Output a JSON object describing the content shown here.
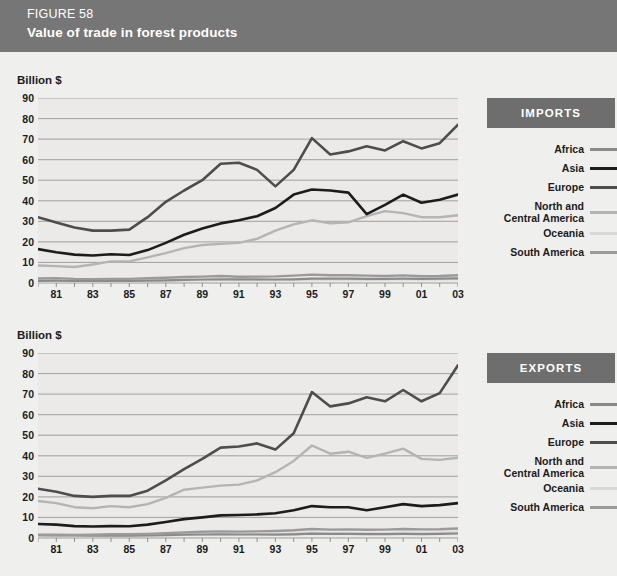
{
  "header": {
    "figure_number": "FIGURE 58",
    "title": "Value of trade in forest products",
    "bg_color": "#767676",
    "text_color": "#ffffff"
  },
  "series_colors": {
    "Africa": "#8a8a8a",
    "Asia": "#1c1c1c",
    "Europe": "#4d4d4d",
    "North and Central America": "#b4b4b4",
    "Oceania": "#d8d8d8",
    "South America": "#9a9a9a"
  },
  "legend": {
    "items": [
      {
        "label": "Africa",
        "swatch_color": "#8a8a8a"
      },
      {
        "label": "Asia",
        "swatch_color": "#1c1c1c"
      },
      {
        "label": "Europe",
        "swatch_color": "#4d4d4d"
      },
      {
        "label": "North and\nCentral America",
        "swatch_color": "#b4b4b4"
      },
      {
        "label": "Oceania",
        "swatch_color": "#d8d8d8"
      },
      {
        "label": "South America",
        "swatch_color": "#9a9a9a"
      }
    ]
  },
  "panels": [
    {
      "badge": "IMPORTS",
      "axis_title": "Billion $"
    },
    {
      "badge": "EXPORTS",
      "axis_title": "Billion $"
    }
  ],
  "chart_data": [
    {
      "type": "line",
      "title": "Value of trade in forest products — IMPORTS",
      "xlabel": "",
      "ylabel": "Billion $",
      "ylim": [
        0,
        90
      ],
      "yticks": [
        0,
        10,
        20,
        30,
        40,
        50,
        60,
        70,
        80,
        90
      ],
      "grid": true,
      "legend_position": "right",
      "x": [
        1980,
        1981,
        1982,
        1983,
        1984,
        1985,
        1986,
        1987,
        1988,
        1989,
        1990,
        1991,
        1992,
        1993,
        1994,
        1995,
        1996,
        1997,
        1998,
        1999,
        2000,
        2001,
        2002,
        2003
      ],
      "xtick_labels": [
        "81",
        "83",
        "85",
        "87",
        "89",
        "91",
        "93",
        "95",
        "97",
        "99",
        "01",
        "03"
      ],
      "xtick_values": [
        1981,
        1983,
        1985,
        1987,
        1989,
        1991,
        1993,
        1995,
        1997,
        1999,
        2001,
        2003
      ],
      "series": [
        {
          "name": "Africa",
          "values": [
            1.0,
            1.1,
            1.0,
            1.0,
            1.0,
            1.0,
            1.1,
            1.3,
            1.5,
            1.7,
            1.8,
            1.8,
            1.8,
            1.7,
            1.8,
            2.1,
            2.1,
            2.1,
            2.0,
            2.0,
            2.1,
            2.0,
            2.1,
            2.3
          ]
        },
        {
          "name": "Asia",
          "values": [
            16.5,
            15.0,
            13.8,
            13.4,
            14.0,
            13.6,
            16.0,
            19.5,
            23.5,
            26.5,
            29.0,
            30.5,
            32.5,
            36.5,
            43.0,
            45.5,
            45.0,
            44.0,
            33.5,
            38.0,
            43.0,
            39.0,
            40.5,
            43.0
          ]
        },
        {
          "name": "Europe",
          "values": [
            32.0,
            29.5,
            27.0,
            25.5,
            25.5,
            26.0,
            32.0,
            39.5,
            45.0,
            50.0,
            58.0,
            58.5,
            55.0,
            47.0,
            55.0,
            70.5,
            62.5,
            64.0,
            66.5,
            64.5,
            69.0,
            65.5,
            68.0,
            77.0
          ]
        },
        {
          "name": "North and Central America",
          "values": [
            8.5,
            8.2,
            7.8,
            9.0,
            10.5,
            10.5,
            12.5,
            14.5,
            17.0,
            18.5,
            19.0,
            19.5,
            21.5,
            25.5,
            28.5,
            30.5,
            29.0,
            29.5,
            32.5,
            35.0,
            34.0,
            32.0,
            32.0,
            33.0
          ]
        },
        {
          "name": "Oceania",
          "values": [
            0.7,
            0.7,
            0.7,
            0.7,
            0.8,
            0.8,
            0.9,
            1.0,
            1.2,
            1.3,
            1.4,
            1.3,
            1.3,
            1.3,
            1.5,
            1.7,
            1.6,
            1.6,
            1.5,
            1.6,
            1.7,
            1.6,
            1.7,
            1.8
          ]
        },
        {
          "name": "South America",
          "values": [
            2.2,
            2.4,
            2.0,
            1.9,
            2.0,
            2.0,
            2.3,
            2.6,
            2.9,
            3.1,
            3.4,
            3.0,
            3.1,
            3.2,
            3.6,
            4.1,
            3.8,
            3.8,
            3.6,
            3.4,
            3.7,
            3.3,
            3.4,
            3.8
          ]
        }
      ]
    },
    {
      "type": "line",
      "title": "Value of trade in forest products — EXPORTS",
      "xlabel": "",
      "ylabel": "Billion $",
      "ylim": [
        0,
        90
      ],
      "yticks": [
        0,
        10,
        20,
        30,
        40,
        50,
        60,
        70,
        80,
        90
      ],
      "grid": true,
      "legend_position": "right",
      "x": [
        1980,
        1981,
        1982,
        1983,
        1984,
        1985,
        1986,
        1987,
        1988,
        1989,
        1990,
        1991,
        1992,
        1993,
        1994,
        1995,
        1996,
        1997,
        1998,
        1999,
        2000,
        2001,
        2002,
        2003
      ],
      "xtick_labels": [
        "81",
        "83",
        "85",
        "87",
        "89",
        "91",
        "93",
        "95",
        "97",
        "99",
        "01",
        "03"
      ],
      "xtick_values": [
        1981,
        1983,
        1985,
        1987,
        1989,
        1991,
        1993,
        1995,
        1997,
        1999,
        2001,
        2003
      ],
      "series": [
        {
          "name": "Africa",
          "values": [
            1.4,
            1.3,
            1.2,
            1.1,
            1.1,
            1.1,
            1.2,
            1.4,
            1.6,
            1.7,
            1.8,
            1.7,
            1.7,
            1.6,
            1.8,
            2.1,
            2.0,
            2.0,
            1.9,
            1.9,
            2.0,
            1.9,
            2.0,
            2.2
          ]
        },
        {
          "name": "Asia",
          "values": [
            6.8,
            6.5,
            5.8,
            5.6,
            5.8,
            5.7,
            6.5,
            7.8,
            9.2,
            10.0,
            11.0,
            11.2,
            11.5,
            12.0,
            13.5,
            15.5,
            15.0,
            15.0,
            13.5,
            15.0,
            16.5,
            15.5,
            16.0,
            17.0
          ]
        },
        {
          "name": "Europe",
          "values": [
            24.0,
            22.5,
            20.5,
            20.0,
            20.5,
            20.5,
            23.0,
            28.0,
            33.5,
            38.5,
            44.0,
            44.5,
            46.0,
            43.0,
            51.0,
            71.0,
            64.0,
            65.5,
            68.5,
            66.5,
            72.0,
            66.5,
            70.5,
            84.0
          ]
        },
        {
          "name": "North and Central America",
          "values": [
            18.0,
            17.0,
            15.0,
            14.5,
            15.5,
            15.0,
            16.5,
            19.5,
            23.5,
            24.5,
            25.5,
            26.0,
            28.0,
            32.0,
            37.5,
            45.0,
            41.0,
            42.0,
            39.0,
            41.0,
            43.5,
            38.5,
            38.0,
            39.0
          ]
        },
        {
          "name": "Oceania",
          "values": [
            1.0,
            1.0,
            0.9,
            0.9,
            1.0,
            1.0,
            1.1,
            1.3,
            1.5,
            1.7,
            1.8,
            1.8,
            1.9,
            2.0,
            2.3,
            2.7,
            2.5,
            2.5,
            2.4,
            2.5,
            2.7,
            2.6,
            2.7,
            2.9
          ]
        },
        {
          "name": "South America",
          "values": [
            1.6,
            1.6,
            1.5,
            1.6,
            1.8,
            1.8,
            2.0,
            2.3,
            2.7,
            3.0,
            3.2,
            3.1,
            3.2,
            3.4,
            3.8,
            4.4,
            4.1,
            4.2,
            4.0,
            4.1,
            4.4,
            4.2,
            4.3,
            4.6
          ]
        }
      ]
    }
  ]
}
